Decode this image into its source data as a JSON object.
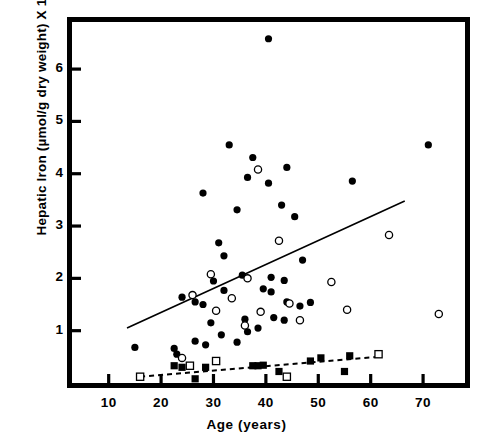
{
  "chart_data": {
    "type": "scatter",
    "title": "",
    "xlabel": "Age (years)",
    "ylabel": "Hepatic Iron (µmol/g dry weight) X 10",
    "ylabel_exponent": "-2",
    "xlim": [
      3,
      78
    ],
    "ylim": [
      0,
      6.9
    ],
    "xticks": [
      10,
      20,
      30,
      40,
      50,
      60,
      70
    ],
    "xtick_labels": [
      "10",
      "20",
      "30",
      "40",
      "50",
      "60",
      "70"
    ],
    "yticks": [
      1,
      2,
      3,
      4,
      5,
      6
    ],
    "ytick_labels": [
      "1",
      "2",
      "3",
      "4",
      "5",
      "6"
    ],
    "grid": false,
    "legend": "none",
    "series": [
      {
        "name": "filled-circle",
        "marker": "filled-circle",
        "color": "#000000",
        "points": [
          [
            40.5,
            6.58
          ],
          [
            33.0,
            4.55
          ],
          [
            37.5,
            4.31
          ],
          [
            44.0,
            4.12
          ],
          [
            71.0,
            4.55
          ],
          [
            28.0,
            3.63
          ],
          [
            36.5,
            3.93
          ],
          [
            40.5,
            3.82
          ],
          [
            56.5,
            3.86
          ],
          [
            34.5,
            3.31
          ],
          [
            43.0,
            3.4
          ],
          [
            45.5,
            3.18
          ],
          [
            31.0,
            2.68
          ],
          [
            32.0,
            2.43
          ],
          [
            35.5,
            2.06
          ],
          [
            30.0,
            1.95
          ],
          [
            41.0,
            2.02
          ],
          [
            43.5,
            1.96
          ],
          [
            47.0,
            2.35
          ],
          [
            26.5,
            1.55
          ],
          [
            28.0,
            1.5
          ],
          [
            24.0,
            1.64
          ],
          [
            32.0,
            1.77
          ],
          [
            39.5,
            1.8
          ],
          [
            41.0,
            1.74
          ],
          [
            44.0,
            1.55
          ],
          [
            46.5,
            1.47
          ],
          [
            48.5,
            1.54
          ],
          [
            36.0,
            1.22
          ],
          [
            41.5,
            1.25
          ],
          [
            43.5,
            1.2
          ],
          [
            29.5,
            1.15
          ],
          [
            38.5,
            1.05
          ],
          [
            36.5,
            0.98
          ],
          [
            31.5,
            0.92
          ],
          [
            34.5,
            0.78
          ],
          [
            26.5,
            0.8
          ],
          [
            28.5,
            0.73
          ],
          [
            15.0,
            0.68
          ],
          [
            22.5,
            0.66
          ],
          [
            23.0,
            0.55
          ]
        ]
      },
      {
        "name": "open-circle",
        "marker": "open-circle",
        "color": "#000000",
        "points": [
          [
            38.5,
            4.08
          ],
          [
            42.5,
            2.72
          ],
          [
            63.5,
            2.83
          ],
          [
            29.5,
            2.08
          ],
          [
            36.5,
            2.0
          ],
          [
            52.5,
            1.93
          ],
          [
            26.0,
            1.68
          ],
          [
            33.5,
            1.62
          ],
          [
            44.5,
            1.52
          ],
          [
            55.5,
            1.4
          ],
          [
            73.0,
            1.32
          ],
          [
            30.5,
            1.38
          ],
          [
            39.0,
            1.36
          ],
          [
            46.5,
            1.2
          ],
          [
            36.0,
            1.1
          ],
          [
            24.0,
            0.48
          ]
        ]
      },
      {
        "name": "filled-square",
        "marker": "filled-square",
        "color": "#000000",
        "points": [
          [
            22.5,
            0.33
          ],
          [
            24.0,
            0.3
          ],
          [
            26.5,
            0.08
          ],
          [
            28.5,
            0.3
          ],
          [
            37.5,
            0.33
          ],
          [
            38.5,
            0.33
          ],
          [
            39.5,
            0.34
          ],
          [
            42.5,
            0.22
          ],
          [
            48.5,
            0.42
          ],
          [
            50.5,
            0.48
          ],
          [
            55.0,
            0.22
          ],
          [
            56.0,
            0.52
          ]
        ]
      },
      {
        "name": "open-square",
        "marker": "open-square",
        "color": "#000000",
        "points": [
          [
            16.0,
            0.12
          ],
          [
            25.5,
            0.33
          ],
          [
            30.5,
            0.42
          ],
          [
            44.0,
            0.12
          ],
          [
            61.5,
            0.55
          ]
        ]
      }
    ],
    "lines": [
      {
        "name": "regression-solid",
        "style": "solid",
        "x0": 13.5,
        "y0": 1.05,
        "x1": 66.5,
        "y1": 3.48
      },
      {
        "name": "regression-dashed",
        "style": "dashed",
        "x0": 16.0,
        "y0": 0.12,
        "x1": 61.5,
        "y1": 0.5
      }
    ]
  },
  "axes": {
    "x_title": "Age (years)",
    "y_title_main": "Hepatic Iron (µmol/g dry weight) X 10",
    "y_title_exp": "-2"
  }
}
